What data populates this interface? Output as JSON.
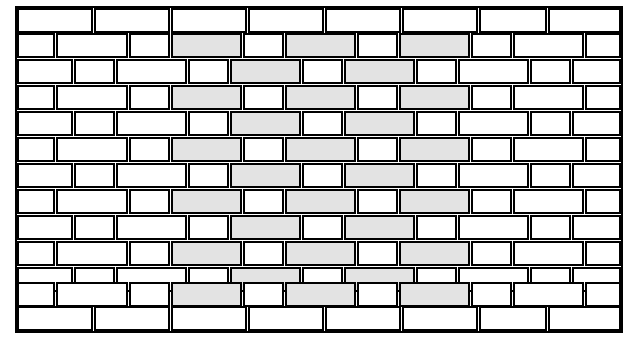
{
  "figure": {
    "kind": "brick-pattern-illustration",
    "canvas": {
      "width": 638,
      "height": 350
    },
    "colors": {
      "background": "#ffffff",
      "brick_fill": "#ffffff",
      "brick_shaded_fill": "#e3e3e3",
      "outline": "#000000"
    },
    "geometry": {
      "field_left": 18,
      "field_top": 9,
      "field_right": 620,
      "field_bottom": 330,
      "border_course_height": 23,
      "row_height": 25,
      "pattern_rows": 11,
      "stroke_width": 1.6,
      "border_stroke_width": 2.2,
      "gap": 2.5
    },
    "legend": {
      "plain_label": "unshaded paver",
      "shaded_label": "shaded paver"
    },
    "top_course": {
      "label": "top border course",
      "y": 9,
      "height": 23,
      "bricks": [
        {
          "x": 18,
          "w": 74
        },
        {
          "x": 95,
          "w": 74
        },
        {
          "x": 172,
          "w": 74
        },
        {
          "x": 249,
          "w": 74
        },
        {
          "x": 326,
          "w": 74
        },
        {
          "x": 403,
          "w": 74
        },
        {
          "x": 480,
          "w": 66
        },
        {
          "x": 549,
          "w": 71
        }
      ]
    },
    "bottom_course": {
      "label": "bottom border course",
      "y": 307,
      "height": 23,
      "bricks": [
        {
          "x": 18,
          "w": 74
        },
        {
          "x": 95,
          "w": 74
        },
        {
          "x": 172,
          "w": 74
        },
        {
          "x": 249,
          "w": 74
        },
        {
          "x": 326,
          "w": 74
        },
        {
          "x": 403,
          "w": 74
        },
        {
          "x": 480,
          "w": 66
        },
        {
          "x": 549,
          "w": 71
        }
      ]
    },
    "rows": [
      {
        "index": 0,
        "type": "A",
        "y": 34,
        "height": 23,
        "bricks": [
          {
            "x": 18,
            "w": 36,
            "shaded": false
          },
          {
            "x": 57,
            "w": 70,
            "shaded": false
          },
          {
            "x": 130,
            "w": 39,
            "shaded": false
          },
          {
            "x": 172,
            "w": 69,
            "shaded": true
          },
          {
            "x": 244,
            "w": 39,
            "shaded": false
          },
          {
            "x": 286,
            "w": 69,
            "shaded": true
          },
          {
            "x": 358,
            "w": 39,
            "shaded": false
          },
          {
            "x": 400,
            "w": 69,
            "shaded": true
          },
          {
            "x": 472,
            "w": 39,
            "shaded": false
          },
          {
            "x": 514,
            "w": 69,
            "shaded": false
          },
          {
            "x": 586,
            "w": 34,
            "shaded": false
          }
        ]
      },
      {
        "index": 1,
        "type": "B",
        "y": 60,
        "height": 23,
        "bricks": [
          {
            "x": 18,
            "w": 54,
            "shaded": false
          },
          {
            "x": 75,
            "w": 39,
            "shaded": false
          },
          {
            "x": 117,
            "w": 69,
            "shaded": false
          },
          {
            "x": 189,
            "w": 39,
            "shaded": false
          },
          {
            "x": 231,
            "w": 69,
            "shaded": true
          },
          {
            "x": 303,
            "w": 39,
            "shaded": false
          },
          {
            "x": 345,
            "w": 69,
            "shaded": true
          },
          {
            "x": 417,
            "w": 39,
            "shaded": false
          },
          {
            "x": 459,
            "w": 69,
            "shaded": false
          },
          {
            "x": 531,
            "w": 39,
            "shaded": false
          },
          {
            "x": 573,
            "w": 47,
            "shaded": false
          }
        ]
      },
      {
        "index": 2,
        "type": "A",
        "y": 86,
        "height": 23,
        "bricks": [
          {
            "x": 18,
            "w": 36,
            "shaded": false
          },
          {
            "x": 57,
            "w": 70,
            "shaded": false
          },
          {
            "x": 130,
            "w": 39,
            "shaded": false
          },
          {
            "x": 172,
            "w": 69,
            "shaded": true
          },
          {
            "x": 244,
            "w": 39,
            "shaded": false
          },
          {
            "x": 286,
            "w": 69,
            "shaded": true
          },
          {
            "x": 358,
            "w": 39,
            "shaded": false
          },
          {
            "x": 400,
            "w": 69,
            "shaded": true
          },
          {
            "x": 472,
            "w": 39,
            "shaded": false
          },
          {
            "x": 514,
            "w": 69,
            "shaded": false
          },
          {
            "x": 586,
            "w": 34,
            "shaded": false
          }
        ]
      },
      {
        "index": 3,
        "type": "B",
        "y": 112,
        "height": 23,
        "bricks": [
          {
            "x": 18,
            "w": 54,
            "shaded": false
          },
          {
            "x": 75,
            "w": 39,
            "shaded": false
          },
          {
            "x": 117,
            "w": 69,
            "shaded": false
          },
          {
            "x": 189,
            "w": 39,
            "shaded": false
          },
          {
            "x": 231,
            "w": 69,
            "shaded": true
          },
          {
            "x": 303,
            "w": 39,
            "shaded": false
          },
          {
            "x": 345,
            "w": 69,
            "shaded": true
          },
          {
            "x": 417,
            "w": 39,
            "shaded": false
          },
          {
            "x": 459,
            "w": 69,
            "shaded": false
          },
          {
            "x": 531,
            "w": 39,
            "shaded": false
          },
          {
            "x": 573,
            "w": 47,
            "shaded": false
          }
        ]
      },
      {
        "index": 4,
        "type": "A",
        "y": 138,
        "height": 23,
        "bricks": [
          {
            "x": 18,
            "w": 36,
            "shaded": false
          },
          {
            "x": 57,
            "w": 70,
            "shaded": false
          },
          {
            "x": 130,
            "w": 39,
            "shaded": false
          },
          {
            "x": 172,
            "w": 69,
            "shaded": true
          },
          {
            "x": 244,
            "w": 39,
            "shaded": false
          },
          {
            "x": 286,
            "w": 69,
            "shaded": true
          },
          {
            "x": 358,
            "w": 39,
            "shaded": false
          },
          {
            "x": 400,
            "w": 69,
            "shaded": true
          },
          {
            "x": 472,
            "w": 39,
            "shaded": false
          },
          {
            "x": 514,
            "w": 69,
            "shaded": false
          },
          {
            "x": 586,
            "w": 34,
            "shaded": false
          }
        ]
      },
      {
        "index": 5,
        "type": "B",
        "y": 164,
        "height": 23,
        "bricks": [
          {
            "x": 18,
            "w": 54,
            "shaded": false
          },
          {
            "x": 75,
            "w": 39,
            "shaded": false
          },
          {
            "x": 117,
            "w": 69,
            "shaded": false
          },
          {
            "x": 189,
            "w": 39,
            "shaded": false
          },
          {
            "x": 231,
            "w": 69,
            "shaded": true
          },
          {
            "x": 303,
            "w": 39,
            "shaded": false
          },
          {
            "x": 345,
            "w": 69,
            "shaded": true
          },
          {
            "x": 417,
            "w": 39,
            "shaded": false
          },
          {
            "x": 459,
            "w": 69,
            "shaded": false
          },
          {
            "x": 531,
            "w": 39,
            "shaded": false
          },
          {
            "x": 573,
            "w": 47,
            "shaded": false
          }
        ]
      },
      {
        "index": 6,
        "type": "A",
        "y": 190,
        "height": 23,
        "bricks": [
          {
            "x": 18,
            "w": 36,
            "shaded": false
          },
          {
            "x": 57,
            "w": 70,
            "shaded": false
          },
          {
            "x": 130,
            "w": 39,
            "shaded": false
          },
          {
            "x": 172,
            "w": 69,
            "shaded": true
          },
          {
            "x": 244,
            "w": 39,
            "shaded": false
          },
          {
            "x": 286,
            "w": 69,
            "shaded": true
          },
          {
            "x": 358,
            "w": 39,
            "shaded": false
          },
          {
            "x": 400,
            "w": 69,
            "shaded": true
          },
          {
            "x": 472,
            "w": 39,
            "shaded": false
          },
          {
            "x": 514,
            "w": 69,
            "shaded": false
          },
          {
            "x": 586,
            "w": 34,
            "shaded": false
          }
        ]
      },
      {
        "index": 7,
        "type": "B",
        "y": 216,
        "height": 23,
        "bricks": [
          {
            "x": 18,
            "w": 54,
            "shaded": false
          },
          {
            "x": 75,
            "w": 39,
            "shaded": false
          },
          {
            "x": 117,
            "w": 69,
            "shaded": false
          },
          {
            "x": 189,
            "w": 39,
            "shaded": false
          },
          {
            "x": 231,
            "w": 69,
            "shaded": true
          },
          {
            "x": 303,
            "w": 39,
            "shaded": false
          },
          {
            "x": 345,
            "w": 69,
            "shaded": true
          },
          {
            "x": 417,
            "w": 39,
            "shaded": false
          },
          {
            "x": 459,
            "w": 69,
            "shaded": false
          },
          {
            "x": 531,
            "w": 39,
            "shaded": false
          },
          {
            "x": 573,
            "w": 47,
            "shaded": false
          }
        ]
      },
      {
        "index": 8,
        "type": "A",
        "y": 242,
        "height": 23,
        "bricks": [
          {
            "x": 18,
            "w": 36,
            "shaded": false
          },
          {
            "x": 57,
            "w": 70,
            "shaded": false
          },
          {
            "x": 130,
            "w": 39,
            "shaded": false
          },
          {
            "x": 172,
            "w": 69,
            "shaded": true
          },
          {
            "x": 244,
            "w": 39,
            "shaded": false
          },
          {
            "x": 286,
            "w": 69,
            "shaded": true
          },
          {
            "x": 358,
            "w": 39,
            "shaded": false
          },
          {
            "x": 400,
            "w": 69,
            "shaded": true
          },
          {
            "x": 472,
            "w": 39,
            "shaded": false
          },
          {
            "x": 514,
            "w": 69,
            "shaded": false
          },
          {
            "x": 586,
            "w": 34,
            "shaded": false
          }
        ]
      },
      {
        "index": 9,
        "type": "B",
        "y": 268,
        "height": 23,
        "bricks": [
          {
            "x": 18,
            "w": 54,
            "shaded": false
          },
          {
            "x": 75,
            "w": 39,
            "shaded": false
          },
          {
            "x": 117,
            "w": 69,
            "shaded": false
          },
          {
            "x": 189,
            "w": 39,
            "shaded": false
          },
          {
            "x": 231,
            "w": 69,
            "shaded": true
          },
          {
            "x": 303,
            "w": 39,
            "shaded": false
          },
          {
            "x": 345,
            "w": 69,
            "shaded": true
          },
          {
            "x": 417,
            "w": 39,
            "shaded": false
          },
          {
            "x": 459,
            "w": 69,
            "shaded": false
          },
          {
            "x": 531,
            "w": 39,
            "shaded": false
          },
          {
            "x": 573,
            "w": 47,
            "shaded": false
          }
        ]
      },
      {
        "index": 10,
        "type": "A",
        "y": 283,
        "height": 23,
        "bricks": [
          {
            "x": 18,
            "w": 36,
            "shaded": false
          },
          {
            "x": 57,
            "w": 70,
            "shaded": false
          },
          {
            "x": 130,
            "w": 39,
            "shaded": false
          },
          {
            "x": 172,
            "w": 69,
            "shaded": true
          },
          {
            "x": 244,
            "w": 39,
            "shaded": false
          },
          {
            "x": 286,
            "w": 69,
            "shaded": true
          },
          {
            "x": 358,
            "w": 39,
            "shaded": false
          },
          {
            "x": 400,
            "w": 69,
            "shaded": true
          },
          {
            "x": 472,
            "w": 39,
            "shaded": false
          },
          {
            "x": 514,
            "w": 69,
            "shaded": false
          },
          {
            "x": 586,
            "w": 34,
            "shaded": false
          }
        ]
      }
    ]
  }
}
